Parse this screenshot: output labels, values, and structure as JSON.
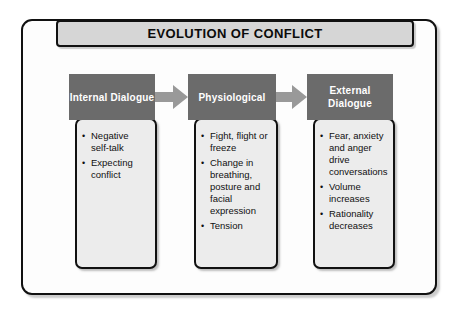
{
  "diagram": {
    "title": "EVOLUTION OF CONFLICT",
    "colors": {
      "frame_border": "#111111",
      "title_bar_bg": "#d6d6d6",
      "header_bg": "#6b6b6b",
      "header_text": "#ffffff",
      "body_bg": "#ececec",
      "body_text": "#101010",
      "arrow_fill": "#999999"
    },
    "stages": [
      {
        "header": "Internal Dialogue",
        "bullets": [
          "Negative self-talk",
          "Expecting conflict"
        ]
      },
      {
        "header": "Physiological",
        "bullets": [
          "Fight, flight or freeze",
          "Change in breathing, posture and facial expression",
          "Tension"
        ]
      },
      {
        "header": "External Dialogue",
        "bullets": [
          "Fear, anxiety and anger drive conversations",
          "Volume increases",
          "Rationality decreases"
        ]
      }
    ],
    "arrows": [
      {
        "label": "arrow-internal-to-physiological"
      },
      {
        "label": "arrow-physiological-to-external"
      }
    ]
  }
}
